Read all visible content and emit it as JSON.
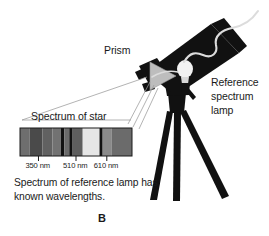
{
  "figure": {
    "panel_letter": "B",
    "background_color": "#ffffff",
    "ink_color": "#1a1a1a"
  },
  "labels": {
    "prism": "Prism",
    "reference_lamp": "Reference spectrum lamp",
    "spectrum_of_star": "Spectrum of star",
    "caption": "Spectrum of reference lamp has known wavelengths."
  },
  "spectrum": {
    "wavelength_ticks": [
      {
        "label": "350 nm",
        "x_frac": 0.165
      },
      {
        "label": "510 nm",
        "x_frac": 0.5
      },
      {
        "label": "610 nm",
        "x_frac": 0.775
      }
    ],
    "bands": [
      {
        "x_frac": 0.0,
        "w_frac": 0.085,
        "color": "#6e6e6e"
      },
      {
        "x_frac": 0.085,
        "w_frac": 0.115,
        "color": "#4a4a4a"
      },
      {
        "x_frac": 0.2,
        "w_frac": 0.09,
        "color": "#616161"
      },
      {
        "x_frac": 0.29,
        "w_frac": 0.075,
        "color": "#727272"
      },
      {
        "x_frac": 0.365,
        "w_frac": 0.03,
        "color": "#111111"
      },
      {
        "x_frac": 0.395,
        "w_frac": 0.045,
        "color": "#6a6a6a"
      },
      {
        "x_frac": 0.44,
        "w_frac": 0.03,
        "color": "#111111"
      },
      {
        "x_frac": 0.47,
        "w_frac": 0.09,
        "color": "#5e5e5e"
      },
      {
        "x_frac": 0.56,
        "w_frac": 0.15,
        "color": "#e6e6e6"
      },
      {
        "x_frac": 0.71,
        "w_frac": 0.028,
        "color": "#111111"
      },
      {
        "x_frac": 0.738,
        "w_frac": 0.082,
        "color": "#8a8a8a"
      },
      {
        "x_frac": 0.82,
        "w_frac": 0.18,
        "color": "#6b6b6b"
      }
    ],
    "frame_color": "#1a1a1a"
  },
  "telescope": {
    "body_color": "#111111",
    "prism_color": "#bdbdbd",
    "bulb_color": "#f2f2f2",
    "cable_color": "#dcdcdc"
  },
  "rays": {
    "color": "#9a9a9a",
    "count": 4
  }
}
